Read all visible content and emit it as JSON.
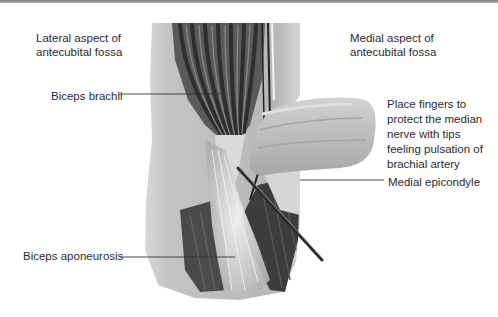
{
  "figure": {
    "labels": {
      "lateral_aspect": "Lateral aspect of antecubital fossa",
      "medial_aspect": "Medial aspect of antecubital fossa",
      "biceps_brachii": "Biceps brachii",
      "biceps_aponeurosis": "Biceps aponeurosis",
      "medial_epicondyle": "Medial epicondyle",
      "fingers_instruction": "Place fingers to protect the median nerve with tips feeling pulsation of brachial artery"
    },
    "colors": {
      "text": "#2b2b2b",
      "leader_line": "#333333",
      "skin": "#c9c9c9",
      "muscle_dark": "#3a3a3a",
      "tendon": "#ececec"
    }
  }
}
